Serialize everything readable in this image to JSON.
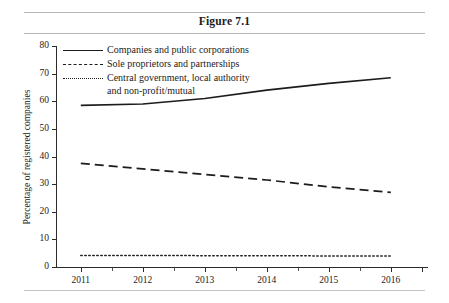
{
  "figure": {
    "title": "Figure 7.1"
  },
  "chart_data": {
    "type": "line",
    "title": "Figure 7.1",
    "xlabel": "",
    "ylabel": "Percentage of registered companies",
    "x": [
      2011,
      2012,
      2013,
      2014,
      2015,
      2016
    ],
    "xticklabels": [
      "2011",
      "2012",
      "2013",
      "2014",
      "2015",
      "2016"
    ],
    "yticklabels": [
      "0",
      "10",
      "20",
      "30",
      "40",
      "50",
      "60",
      "70",
      "80"
    ],
    "yticks": [
      0,
      10,
      20,
      30,
      40,
      50,
      60,
      70,
      80
    ],
    "xlim": [
      2010.6,
      2016.6
    ],
    "ylim": [
      0,
      80
    ],
    "grid": false,
    "legend_position": "upper-left-inside",
    "series": [
      {
        "name": "Companies and public corporations",
        "style": "solid",
        "color": "#1c1c1c",
        "values": [
          58.5,
          59.0,
          61.0,
          64.0,
          66.5,
          68.5
        ]
      },
      {
        "name": "Sole proprietors and partnerships",
        "style": "dashed",
        "color": "#1c1c1c",
        "values": [
          37.5,
          35.5,
          33.5,
          31.5,
          29.0,
          27.0
        ]
      },
      {
        "name": "Central government, local authority\nand non-profit/mutual",
        "style": "dotted",
        "color": "#1c1c1c",
        "values": [
          4.2,
          4.2,
          4.1,
          4.1,
          4.0,
          4.0
        ]
      }
    ]
  }
}
